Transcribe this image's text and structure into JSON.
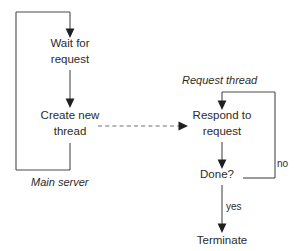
{
  "diagram": {
    "background_color": "#ffffff",
    "stroke_color": "#4a4a4a",
    "dashed_stroke_color": "#6f6f6f",
    "text_color": "#2b2b2b",
    "groups": [
      {
        "id": "main-server",
        "label": "Main server",
        "style": "italic"
      },
      {
        "id": "request-thread",
        "label": "Request thread",
        "style": "italic"
      }
    ],
    "nodes": [
      {
        "id": "wait-for-request",
        "lines": [
          "Wait for",
          "request"
        ],
        "x": 70,
        "y1": 47,
        "y2": 63
      },
      {
        "id": "create-new-thread",
        "lines": [
          "Create new",
          "thread"
        ],
        "x": 70,
        "y1": 119,
        "y2": 135
      },
      {
        "id": "respond-to-request",
        "lines": [
          "Respond to",
          "request"
        ],
        "x": 222,
        "y1": 119,
        "y2": 135
      },
      {
        "id": "done",
        "lines": [
          "Done?"
        ],
        "x": 217,
        "y1": 178,
        "y2": null
      },
      {
        "id": "terminate",
        "lines": [
          "Terminate"
        ],
        "x": 222,
        "y1": 244,
        "y2": null
      }
    ],
    "edge_labels": [
      {
        "id": "no",
        "text": "no",
        "x": 277,
        "y": 167
      },
      {
        "id": "yes",
        "text": "yes",
        "x": 226,
        "y": 210
      }
    ],
    "group_label_positions": [
      {
        "id": "main-server",
        "x": 31,
        "y": 186
      },
      {
        "id": "request-thread",
        "x": 182,
        "y": 84
      }
    ]
  }
}
